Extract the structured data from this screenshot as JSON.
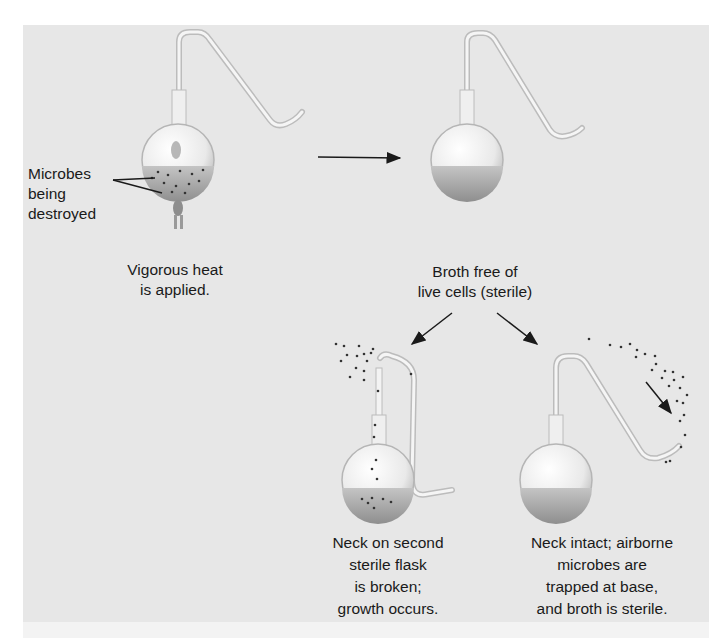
{
  "figure": {
    "steps": [
      {
        "id": "heating",
        "caption": [
          "Vigorous heat",
          "is applied."
        ],
        "label": [
          "Microbes",
          "being",
          "destroyed"
        ]
      },
      {
        "id": "sterile",
        "caption": [
          "Broth free of",
          "live cells (sterile)"
        ]
      },
      {
        "id": "broken",
        "caption": [
          "Neck on second",
          "sterile flask",
          "is broken;",
          "growth occurs."
        ]
      },
      {
        "id": "intact",
        "caption": [
          "Neck intact; airborne",
          "microbes are",
          "trapped at base,",
          "and broth is sterile."
        ]
      }
    ],
    "colors": {
      "panel": "#e7e7e7",
      "glass": "#f4f4f4",
      "broth": "#a9a9a9",
      "text": "#1a1a1a",
      "arrow": "#1a1a1a"
    }
  }
}
